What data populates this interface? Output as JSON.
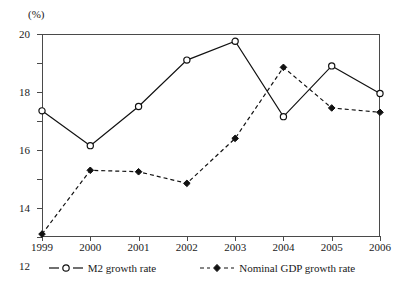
{
  "chart_data": {
    "type": "line",
    "title": "",
    "xlabel": "",
    "ylabel": "(%)",
    "unit_label": "(%)",
    "categories": [
      "1999",
      "2000",
      "2001",
      "2002",
      "2003",
      "2004",
      "2005",
      "2006"
    ],
    "ylim": [
      6,
      20
    ],
    "yticks": [
      6,
      8,
      10,
      12,
      14,
      16,
      18,
      20
    ],
    "ytick_labels": [
      "6",
      "8",
      "10",
      "12",
      "14",
      "16",
      "18",
      "20"
    ],
    "grid": false,
    "legend_position": "bottom",
    "series": [
      {
        "name": "M2 growth rate",
        "style": "solid",
        "marker": "open-circle",
        "color": "#111111",
        "values": [
          14.7,
          12.3,
          15.0,
          18.2,
          19.5,
          14.3,
          17.8,
          15.9
        ]
      },
      {
        "name": "Nominal GDP growth rate",
        "style": "dashed",
        "marker": "filled-diamond",
        "color": "#111111",
        "values": [
          6.2,
          10.6,
          10.5,
          9.7,
          12.8,
          17.7,
          14.9,
          14.6
        ]
      }
    ]
  },
  "legend": {
    "items": [
      {
        "label": "M2 growth rate"
      },
      {
        "label": "Nominal GDP growth rate"
      }
    ]
  }
}
